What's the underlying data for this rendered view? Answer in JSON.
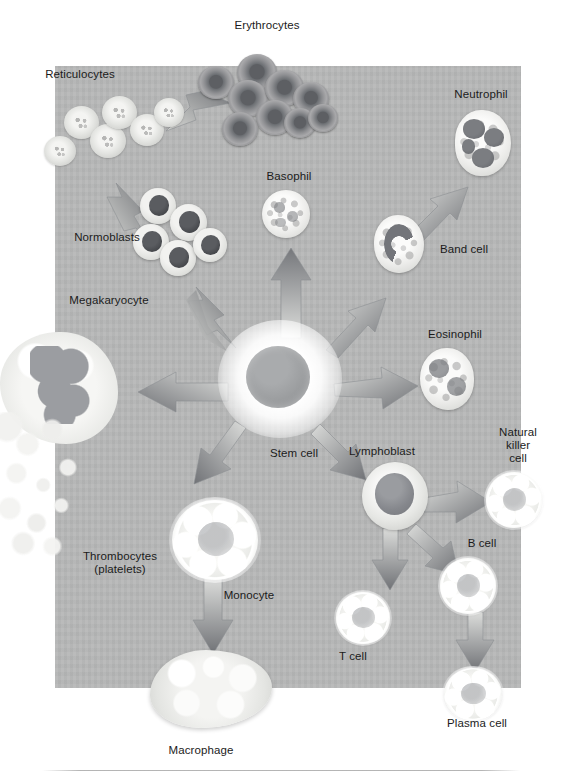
{
  "figure": {
    "panel_color": "#b6b7b7",
    "label_color": "#1b1b1b"
  },
  "labels": {
    "erythrocytes": "Erythrocytes",
    "reticulocytes": "Reticulocytes",
    "normoblasts": "Normoblasts",
    "megakaryocyte": "Megakaryocyte",
    "thrombocytes": "Thrombocytes\n(platelets)",
    "basophil": "Basophil",
    "neutrophil": "Neutrophil",
    "band_cell": "Band cell",
    "eosinophil": "Eosinophil",
    "stem_cell": "Stem cell",
    "lymphoblast": "Lymphoblast",
    "natural_killer_cell": "Natural\nkiller\ncell",
    "b_cell": "B cell",
    "t_cell": "T cell",
    "plasma_cell": "Plasma cell",
    "monocyte": "Monocyte",
    "macrophage": "Macrophage"
  },
  "cells": [
    {
      "key": "stem_cell",
      "label": "Stem cell",
      "stage": "progenitor"
    },
    {
      "key": "normoblasts",
      "label": "Normoblasts",
      "stage": "erythroid"
    },
    {
      "key": "reticulocytes",
      "label": "Reticulocytes",
      "stage": "erythroid"
    },
    {
      "key": "erythrocytes",
      "label": "Erythrocytes",
      "stage": "erythroid"
    },
    {
      "key": "megakaryocyte",
      "label": "Megakaryocyte",
      "stage": "thrombocytic"
    },
    {
      "key": "thrombocytes",
      "label": "Thrombocytes (platelets)",
      "stage": "thrombocytic"
    },
    {
      "key": "basophil",
      "label": "Basophil",
      "stage": "granulocyte"
    },
    {
      "key": "band_cell",
      "label": "Band cell",
      "stage": "granulocyte"
    },
    {
      "key": "neutrophil",
      "label": "Neutrophil",
      "stage": "granulocyte"
    },
    {
      "key": "eosinophil",
      "label": "Eosinophil",
      "stage": "granulocyte"
    },
    {
      "key": "monocyte",
      "label": "Monocyte",
      "stage": "monocytic"
    },
    {
      "key": "macrophage",
      "label": "Macrophage",
      "stage": "monocytic"
    },
    {
      "key": "lymphoblast",
      "label": "Lymphoblast",
      "stage": "lymphoid"
    },
    {
      "key": "natural_killer_cell",
      "label": "Natural killer cell",
      "stage": "lymphoid"
    },
    {
      "key": "t_cell",
      "label": "T cell",
      "stage": "lymphoid"
    },
    {
      "key": "b_cell",
      "label": "B cell",
      "stage": "lymphoid"
    },
    {
      "key": "plasma_cell",
      "label": "Plasma cell",
      "stage": "lymphoid"
    }
  ],
  "arrows": [
    {
      "from": "stem_cell",
      "to": "normoblasts"
    },
    {
      "from": "normoblasts",
      "to": "reticulocytes"
    },
    {
      "from": "reticulocytes",
      "to": "erythrocytes"
    },
    {
      "from": "stem_cell",
      "to": "megakaryocyte"
    },
    {
      "from": "stem_cell",
      "to": "basophil"
    },
    {
      "from": "stem_cell",
      "to": "band_cell"
    },
    {
      "from": "band_cell",
      "to": "neutrophil"
    },
    {
      "from": "stem_cell",
      "to": "eosinophil"
    },
    {
      "from": "stem_cell",
      "to": "monocyte"
    },
    {
      "from": "monocyte",
      "to": "macrophage"
    },
    {
      "from": "stem_cell",
      "to": "lymphoblast"
    },
    {
      "from": "lymphoblast",
      "to": "natural_killer_cell"
    },
    {
      "from": "lymphoblast",
      "to": "t_cell"
    },
    {
      "from": "lymphoblast",
      "to": "b_cell"
    },
    {
      "from": "b_cell",
      "to": "plasma_cell"
    }
  ]
}
